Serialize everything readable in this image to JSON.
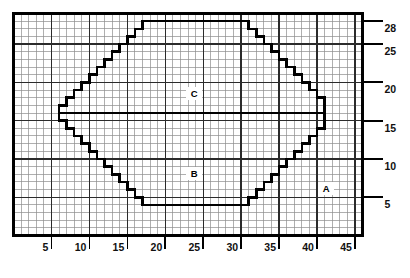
{
  "chart_data": {
    "type": "area",
    "title": "",
    "xlabel": "",
    "ylabel": "",
    "xlim": [
      0,
      46
    ],
    "ylim": [
      0,
      29
    ],
    "grid": true,
    "grid_minor_step": 1,
    "grid_major_step": 5,
    "legend": "none",
    "x_ticks": [
      5,
      10,
      15,
      20,
      25,
      30,
      35,
      40,
      45
    ],
    "x_tick_labels": [
      "5",
      "10",
      "15",
      "20",
      "25",
      "30",
      "35",
      "40",
      "45"
    ],
    "y_ticks": [
      5,
      10,
      15,
      20,
      25,
      28
    ],
    "y_tick_labels": [
      "5",
      "10",
      "15",
      "20",
      "25",
      "28"
    ],
    "annotations": [
      {
        "text": "C",
        "x": 23.8,
        "y": 18.6
      },
      {
        "text": "B",
        "x": 23.8,
        "y": 8.1
      },
      {
        "text": "A",
        "x": 41.2,
        "y": 6.1
      }
    ],
    "series": [
      {
        "name": "region-outline",
        "type": "stepped-polygon",
        "points": [
          [
            6,
            15
          ],
          [
            6,
            17
          ],
          [
            7,
            17
          ],
          [
            7,
            18
          ],
          [
            8,
            18
          ],
          [
            8,
            19
          ],
          [
            9,
            19
          ],
          [
            9,
            20
          ],
          [
            10,
            20
          ],
          [
            10,
            21
          ],
          [
            11,
            21
          ],
          [
            11,
            22
          ],
          [
            12,
            22
          ],
          [
            12,
            23
          ],
          [
            13,
            23
          ],
          [
            13,
            24
          ],
          [
            14,
            24
          ],
          [
            14,
            25
          ],
          [
            15,
            25
          ],
          [
            15,
            26
          ],
          [
            16,
            26
          ],
          [
            16,
            27
          ],
          [
            17,
            27
          ],
          [
            17,
            28
          ],
          [
            31,
            28
          ],
          [
            31,
            27
          ],
          [
            32,
            27
          ],
          [
            32,
            26
          ],
          [
            33,
            26
          ],
          [
            33,
            25
          ],
          [
            34,
            25
          ],
          [
            34,
            24
          ],
          [
            35,
            24
          ],
          [
            35,
            23
          ],
          [
            36,
            23
          ],
          [
            36,
            22
          ],
          [
            37,
            22
          ],
          [
            37,
            21
          ],
          [
            38,
            21
          ],
          [
            38,
            20
          ],
          [
            39,
            20
          ],
          [
            39,
            19
          ],
          [
            40,
            19
          ],
          [
            40,
            18
          ],
          [
            41,
            18
          ],
          [
            41,
            15
          ],
          [
            41,
            14
          ],
          [
            40,
            14
          ],
          [
            40,
            13
          ],
          [
            39,
            13
          ],
          [
            39,
            12
          ],
          [
            38,
            12
          ],
          [
            38,
            11
          ],
          [
            37,
            11
          ],
          [
            37,
            10
          ],
          [
            36,
            10
          ],
          [
            36,
            9
          ],
          [
            35,
            9
          ],
          [
            35,
            8
          ],
          [
            34,
            8
          ],
          [
            34,
            7
          ],
          [
            33,
            7
          ],
          [
            33,
            6
          ],
          [
            32,
            6
          ],
          [
            32,
            5
          ],
          [
            31,
            5
          ],
          [
            31,
            4
          ],
          [
            17,
            4
          ],
          [
            17,
            5
          ],
          [
            16,
            5
          ],
          [
            16,
            6
          ],
          [
            15,
            6
          ],
          [
            15,
            7
          ],
          [
            14,
            7
          ],
          [
            14,
            8
          ],
          [
            13,
            8
          ],
          [
            13,
            9
          ],
          [
            12,
            9
          ],
          [
            12,
            10
          ],
          [
            11,
            10
          ],
          [
            11,
            11
          ],
          [
            10,
            11
          ],
          [
            10,
            12
          ],
          [
            9,
            12
          ],
          [
            9,
            13
          ],
          [
            8,
            13
          ],
          [
            8,
            14
          ],
          [
            7,
            14
          ],
          [
            7,
            15
          ]
        ]
      },
      {
        "name": "divider-line",
        "type": "line",
        "points": [
          [
            6,
            16
          ],
          [
            41,
            16
          ]
        ]
      }
    ]
  },
  "axes": {
    "x_axis_name": "x-axis",
    "y_axis_name": "y-axis"
  }
}
